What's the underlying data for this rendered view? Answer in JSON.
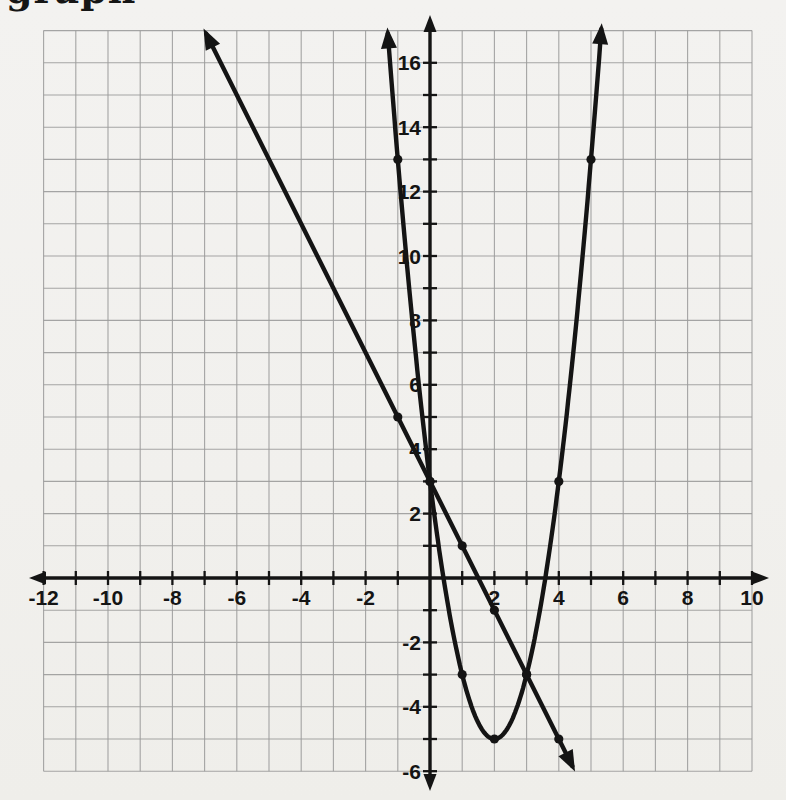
{
  "page": {
    "background": "#f2f1ee",
    "heading_fragment": "graph"
  },
  "chart_data": {
    "type": "line",
    "title": "",
    "xlabel": "",
    "ylabel": "",
    "xlim": [
      -12,
      10
    ],
    "ylim": [
      -6,
      17
    ],
    "grid": true,
    "grid_step": 1,
    "x_tick_step": 1,
    "y_tick_step": 1,
    "x_tick_labels": [
      "-12",
      "-10",
      "-8",
      "-6",
      "-4",
      "-2",
      "2",
      "4",
      "6",
      "8",
      "10"
    ],
    "y_tick_labels": [
      "16",
      "14",
      "12",
      "10",
      "8",
      "6",
      "4",
      "2",
      "-2",
      "-4",
      "-6"
    ],
    "series": [
      {
        "name": "line",
        "equation": "y = -2x + 3",
        "kind": "linear",
        "slope": -2,
        "intercept": 3,
        "x_range": [
          -6.95,
          4.42
        ],
        "marked_points": [
          [
            -1,
            5
          ],
          [
            0,
            3
          ],
          [
            1,
            1
          ],
          [
            2,
            -1
          ],
          [
            3,
            -3
          ],
          [
            4,
            -5
          ]
        ]
      },
      {
        "name": "parabola",
        "equation": "y = 2(x-2)^2 - 5",
        "kind": "quadratic",
        "a": 2,
        "vertex": [
          2,
          -5
        ],
        "x_range": [
          -1.31,
          5.32
        ],
        "marked_points": [
          [
            -1,
            13
          ],
          [
            0,
            3
          ],
          [
            1,
            -3
          ],
          [
            2,
            -5
          ],
          [
            3,
            -3
          ],
          [
            4,
            3
          ],
          [
            5,
            13
          ]
        ]
      }
    ],
    "intersection_points": [
      [
        0,
        3
      ],
      [
        3,
        -3
      ]
    ],
    "colors": {
      "axis": "#141414",
      "curve": "#141414",
      "grid": "#9c9c9c",
      "label": "#141414"
    }
  }
}
